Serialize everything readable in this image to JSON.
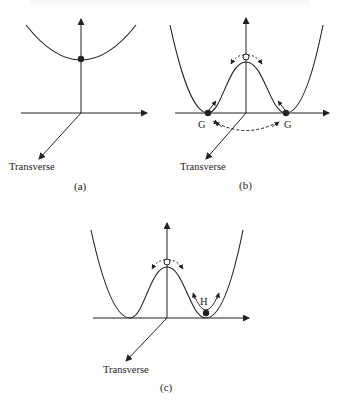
{
  "figure": {
    "panels": [
      {
        "id": "a",
        "caption": "(a)",
        "axis_label": "Transverse",
        "curve": "single-well parabola",
        "markers": [
          {
            "type": "filled-dot",
            "position": "well bottom"
          }
        ]
      },
      {
        "id": "b",
        "caption": "(b)",
        "axis_label": "Transverse",
        "curve": "double-well",
        "markers": [
          {
            "type": "filled-dot",
            "label": "G",
            "position": "left minimum"
          },
          {
            "type": "filled-dot",
            "label": "G",
            "position": "right minimum"
          },
          {
            "type": "open-circle",
            "position": "barrier top"
          }
        ]
      },
      {
        "id": "c",
        "caption": "(c)",
        "axis_label": "Transverse",
        "curve": "double-well",
        "markers": [
          {
            "type": "filled-dot",
            "label": "H",
            "position": "right well"
          },
          {
            "type": "open-circle",
            "position": "barrier top"
          }
        ]
      }
    ],
    "labels": {
      "a_transverse": "Transverse",
      "a_caption": "(a)",
      "b_transverse": "Transverse",
      "b_caption": "(b)",
      "b_G_left": "G",
      "b_G_right": "G",
      "c_transverse": "Transverse",
      "c_caption": "(c)",
      "c_H": "H"
    },
    "colors": {
      "stroke": "#222222",
      "background": "#ffffff"
    }
  }
}
